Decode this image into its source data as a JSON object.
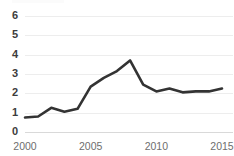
{
  "chart_data": {
    "type": "line",
    "title": "",
    "subtitle": "",
    "xlabel": "",
    "ylabel": "",
    "x": [
      2000,
      2001,
      2002,
      2003,
      2004,
      2005,
      2006,
      2007,
      2008,
      2009,
      2010,
      2011,
      2012,
      2013,
      2014,
      2015
    ],
    "values": [
      0.75,
      0.8,
      1.25,
      1.05,
      1.2,
      2.35,
      2.8,
      3.15,
      3.7,
      2.45,
      2.1,
      2.25,
      2.05,
      2.1,
      2.1,
      2.25
    ],
    "series": [
      {
        "name": "",
        "color": "#333333",
        "values": [
          0.75,
          0.8,
          1.25,
          1.05,
          1.2,
          2.35,
          2.8,
          3.15,
          3.7,
          2.45,
          2.1,
          2.25,
          2.05,
          2.1,
          2.1,
          2.25
        ]
      }
    ],
    "xlim": [
      2000,
      2015
    ],
    "ylim": [
      0,
      6
    ],
    "x_ticks": [
      2000,
      2005,
      2010,
      2015
    ],
    "x_tick_labels": [
      "2000",
      "2005",
      "2010",
      "2015"
    ],
    "y_ticks": [
      0,
      1,
      2,
      3,
      4,
      5,
      6
    ],
    "y_tick_labels": [
      "0",
      "1",
      "2",
      "3",
      "4",
      "5",
      "6"
    ],
    "grid": true,
    "grid_axis": "y",
    "grid_color": "#ededed",
    "legend": false,
    "legend_position": "none",
    "annotations": []
  },
  "colors": {
    "background": "#ffffff",
    "line": "#333333",
    "grid": "#ededed",
    "baseline": "#d9d9d9",
    "y_tick_text": "#3c3c3c",
    "x_tick_text": "#6e6e6e"
  }
}
